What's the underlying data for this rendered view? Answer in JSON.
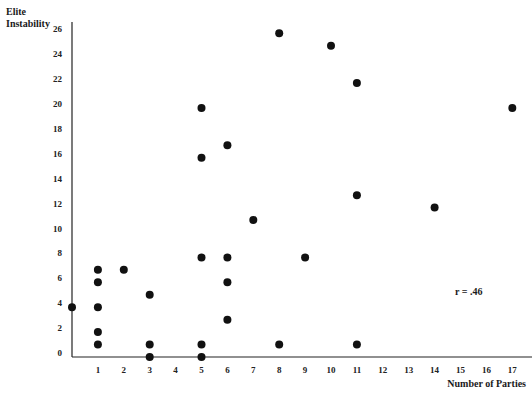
{
  "chart_data": {
    "type": "scatter",
    "title": "",
    "xlabel": "Number of Parties",
    "ylabel": "Elite Instability",
    "ylabel_lines": [
      "Elite",
      "Instability"
    ],
    "annotation": "r = .46",
    "xlim": [
      0,
      17.8
    ],
    "ylim": [
      0,
      27
    ],
    "x_ticks": [
      1,
      2,
      3,
      4,
      5,
      6,
      7,
      8,
      9,
      10,
      11,
      12,
      13,
      14,
      15,
      16,
      17
    ],
    "y_ticks": [
      0,
      2,
      4,
      6,
      8,
      10,
      12,
      14,
      16,
      18,
      20,
      22,
      24,
      26
    ],
    "grid": false,
    "legend": null,
    "points": [
      {
        "x": 0,
        "y": 4
      },
      {
        "x": 1,
        "y": 7
      },
      {
        "x": 1,
        "y": 6
      },
      {
        "x": 1,
        "y": 4
      },
      {
        "x": 1,
        "y": 2
      },
      {
        "x": 1,
        "y": 1
      },
      {
        "x": 2,
        "y": 7
      },
      {
        "x": 3,
        "y": 5
      },
      {
        "x": 3,
        "y": 1
      },
      {
        "x": 3,
        "y": 0
      },
      {
        "x": 5,
        "y": 20
      },
      {
        "x": 5,
        "y": 16
      },
      {
        "x": 5,
        "y": 8
      },
      {
        "x": 5,
        "y": 1
      },
      {
        "x": 5,
        "y": 0
      },
      {
        "x": 6,
        "y": 17
      },
      {
        "x": 6,
        "y": 8
      },
      {
        "x": 6,
        "y": 6
      },
      {
        "x": 6,
        "y": 3
      },
      {
        "x": 7,
        "y": 11
      },
      {
        "x": 8,
        "y": 26
      },
      {
        "x": 8,
        "y": 1
      },
      {
        "x": 9,
        "y": 8
      },
      {
        "x": 10,
        "y": 25
      },
      {
        "x": 11,
        "y": 22
      },
      {
        "x": 11,
        "y": 13
      },
      {
        "x": 11,
        "y": 1
      },
      {
        "x": 14,
        "y": 12
      },
      {
        "x": 17,
        "y": 20
      }
    ],
    "style": {
      "point_color": "#111111",
      "axis_color": "#222222",
      "point_radius": 4
    }
  }
}
